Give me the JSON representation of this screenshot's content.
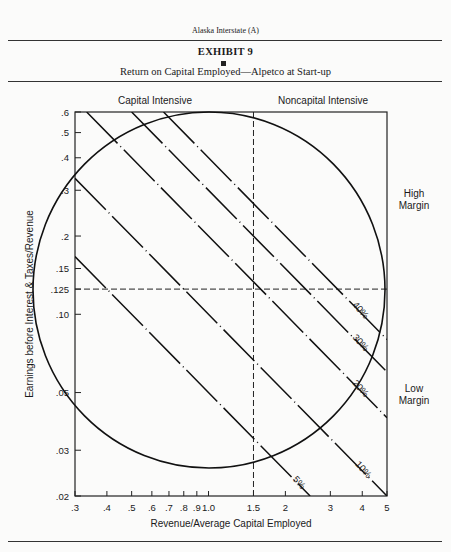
{
  "page": {
    "running_head": "Alaska Interstate (A)",
    "exhibit_label": "EXHIBIT 9",
    "subtitle": "Return on Capital Employed—Alpetco at Start-up"
  },
  "chart_data": {
    "type": "line",
    "title": "Return on Capital Employed—Alpetco at Start-up",
    "xlabel": "Revenue/Average Capital Employed",
    "ylabel": "Earnings before Interest & Taxes/Revenue",
    "xscale": "log",
    "yscale": "log",
    "xlim": [
      0.3,
      5
    ],
    "ylim": [
      0.02,
      0.6
    ],
    "x_ticks": [
      0.3,
      0.4,
      0.5,
      0.6,
      0.7,
      0.8,
      0.9,
      1.0,
      1.5,
      2,
      3,
      4,
      5
    ],
    "x_tick_labels": [
      ".3",
      ".4",
      ".5",
      ".6",
      ".7",
      ".8",
      ".9",
      "1.0",
      "1.5",
      "2",
      "3",
      "4",
      "5"
    ],
    "y_ticks": [
      0.02,
      0.03,
      0.05,
      0.1,
      0.125,
      0.15,
      0.2,
      0.3,
      0.4,
      0.5,
      0.6
    ],
    "y_tick_labels": [
      ".02",
      ".03",
      ".05",
      ".10",
      ".125",
      ".15",
      ".2",
      ".3",
      ".4",
      ".5",
      ".6"
    ],
    "grid": false,
    "reference_lines": {
      "vertical_x": 1.5,
      "horizontal_y": 0.125
    },
    "series": [
      {
        "name": "5%",
        "roce": 0.05,
        "style": "dash-dot",
        "description": "iso-ROCE line: margin × turnover = 0.05"
      },
      {
        "name": "10%",
        "roce": 0.1,
        "style": "dash-dot",
        "description": "iso-ROCE line: margin × turnover = 0.10"
      },
      {
        "name": "20%",
        "roce": 0.2,
        "style": "dash-dot",
        "description": "iso-ROCE line: margin × turnover = 0.20"
      },
      {
        "name": "30%",
        "roce": 0.3,
        "style": "dash-dot",
        "description": "iso-ROCE line: margin × turnover = 0.30"
      },
      {
        "name": "40%",
        "roce": 0.4,
        "style": "dash-dot",
        "description": "iso-ROCE line: margin × turnover = 0.40"
      }
    ],
    "ellipse": {
      "description": "large circle region centered near x≈1.0, y≈0.125"
    },
    "quadrant_labels": {
      "top_left": "Capital Intensive",
      "top_right": "Noncapital Intensive",
      "right_upper": [
        "High",
        "Margin"
      ],
      "right_lower": [
        "Low",
        "Margin"
      ]
    }
  }
}
